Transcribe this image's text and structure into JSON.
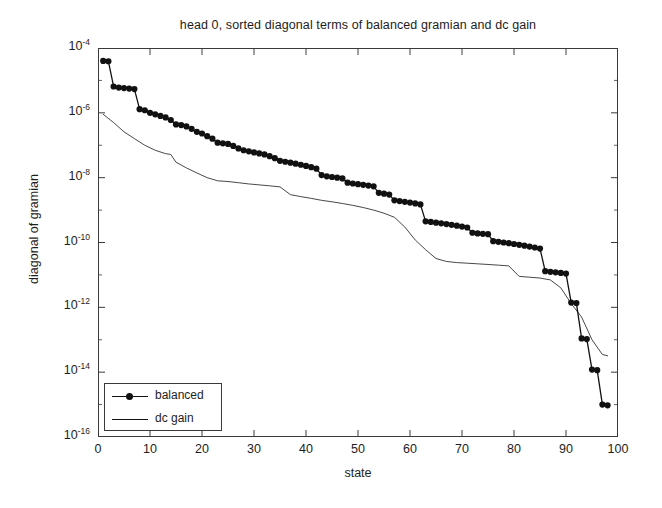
{
  "chart_data": {
    "type": "line",
    "title": "head 0, sorted diagonal terms of balanced gramian and dc gain",
    "xlabel": "state",
    "ylabel": "diagonal of gramian",
    "xlim": [
      0,
      100
    ],
    "ylim": [
      1e-16,
      0.0001
    ],
    "yscale": "log",
    "grid": false,
    "legend_position": "lower left",
    "xticks": [
      0,
      10,
      20,
      30,
      40,
      50,
      60,
      70,
      80,
      90,
      100
    ],
    "xtick_labels": [
      "0",
      "10",
      "20",
      "30",
      "40",
      "50",
      "60",
      "70",
      "80",
      "90",
      "100"
    ],
    "yticks": [
      0.0001,
      1e-06,
      1e-08,
      1e-10,
      1e-12,
      1e-14,
      1e-16
    ],
    "ytick_labels": [
      "10-4",
      "10-6",
      "10-8",
      "10-10",
      "10-12",
      "10-14",
      "10-16"
    ],
    "ytick_mantissa": "10",
    "ytick_exponents": [
      "-4",
      "-6",
      "-8",
      "-10",
      "-12",
      "-14",
      "-16"
    ],
    "series": [
      {
        "name": "balanced",
        "marker": "filled-circle",
        "linestyle": "solid",
        "color": "#111111",
        "x": [
          1,
          2,
          3,
          4,
          5,
          6,
          7,
          8,
          9,
          10,
          11,
          12,
          13,
          14,
          15,
          16,
          17,
          18,
          19,
          20,
          21,
          22,
          23,
          24,
          25,
          26,
          27,
          28,
          29,
          30,
          31,
          32,
          33,
          34,
          35,
          36,
          37,
          38,
          39,
          40,
          41,
          42,
          43,
          44,
          45,
          46,
          47,
          48,
          49,
          50,
          51,
          52,
          53,
          54,
          55,
          56,
          57,
          58,
          59,
          60,
          61,
          62,
          63,
          64,
          65,
          66,
          67,
          68,
          69,
          70,
          71,
          72,
          73,
          74,
          75,
          76,
          77,
          78,
          79,
          80,
          81,
          82,
          83,
          84,
          85,
          86,
          87,
          88,
          89,
          90,
          91,
          92,
          93,
          94,
          95,
          96,
          97,
          98
        ],
        "y": [
          4e-05,
          3.9e-05,
          6.5e-06,
          6e-06,
          5.8e-06,
          5.6e-06,
          5.4e-06,
          1.3e-06,
          1.2e-06,
          1e-06,
          9e-07,
          8e-07,
          7.2e-07,
          6e-07,
          4.4e-07,
          4.2e-07,
          3.8e-07,
          3.2e-07,
          2.6e-07,
          2.3e-07,
          1.9e-07,
          1.6e-07,
          1.2e-07,
          1.15e-07,
          1.1e-07,
          9.5e-08,
          8e-08,
          7e-08,
          6.5e-08,
          6e-08,
          5.6e-08,
          5.2e-08,
          4.6e-08,
          4e-08,
          3.3e-08,
          3.1e-08,
          2.9e-08,
          2.7e-08,
          2.5e-08,
          2.3e-08,
          2.1e-08,
          1.9e-08,
          1.2e-08,
          1.1e-08,
          1.05e-08,
          1e-08,
          9.5e-09,
          7e-09,
          6.6e-09,
          6.3e-09,
          6e-09,
          5.7e-09,
          5.4e-09,
          3.4e-09,
          3.2e-09,
          3e-09,
          2e-09,
          1.9e-09,
          1.8e-09,
          1.7e-09,
          1.6e-09,
          1.5e-09,
          4.5e-10,
          4.3e-10,
          4.1e-10,
          3.9e-10,
          3.7e-10,
          3.5e-10,
          3.3e-10,
          3.1e-10,
          2.9e-10,
          2e-10,
          1.9e-10,
          1.85e-10,
          1.8e-10,
          1.1e-10,
          1.05e-10,
          1e-10,
          9.5e-11,
          9e-11,
          8.5e-11,
          8e-11,
          7.5e-11,
          7e-11,
          6.5e-11,
          1.3e-11,
          1.25e-11,
          1.2e-11,
          1.15e-11,
          1.1e-11,
          1.4e-12,
          1.35e-12,
          1.1e-13,
          1.05e-13,
          1.2e-14,
          1.15e-14,
          1e-15,
          9.5e-16
        ]
      },
      {
        "name": "dc gain",
        "marker": "none",
        "linestyle": "solid",
        "color": "#333333",
        "x": [
          1,
          3,
          5,
          7,
          9,
          11,
          13,
          14,
          15,
          17,
          19,
          21,
          23,
          25,
          27,
          29,
          31,
          33,
          35,
          37,
          39,
          41,
          43,
          45,
          47,
          49,
          51,
          53,
          55,
          57,
          59,
          61,
          63,
          65,
          67,
          69,
          71,
          73,
          75,
          77,
          79,
          81,
          83,
          85,
          87,
          89,
          91,
          93,
          95,
          97,
          98
        ],
        "y": [
          9e-07,
          5e-07,
          2.6e-07,
          1.6e-07,
          1e-07,
          7e-08,
          5.5e-08,
          5.2e-08,
          3e-08,
          2e-08,
          1.4e-08,
          1e-08,
          8e-09,
          7.6e-09,
          7e-09,
          6.4e-09,
          6e-09,
          5.6e-09,
          5.2e-09,
          3e-09,
          2.6e-09,
          2.3e-09,
          2e-09,
          1.8e-09,
          1.6e-09,
          1.4e-09,
          1.2e-09,
          1e-09,
          8e-10,
          6e-10,
          3e-10,
          1.2e-10,
          6e-11,
          3.2e-11,
          2.6e-11,
          2.4e-11,
          2.3e-11,
          2.2e-11,
          2.1e-11,
          2e-11,
          1.9e-11,
          9e-12,
          8.5e-12,
          8e-12,
          7e-12,
          4e-12,
          1.3e-12,
          5e-13,
          1e-13,
          3.5e-14,
          3.2e-14
        ]
      }
    ]
  },
  "legend": {
    "entries": [
      {
        "label": "balanced"
      },
      {
        "label": "dc gain"
      }
    ]
  },
  "style": {
    "axis_color": "#3a3a3a",
    "background": "#ffffff",
    "text_color": "#1d1d1d"
  }
}
